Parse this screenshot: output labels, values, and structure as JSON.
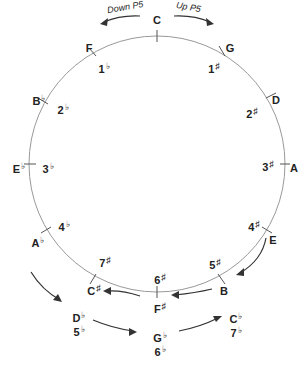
{
  "diagram": {
    "direction_labels": {
      "down": "Down P5",
      "up": "Up P5"
    },
    "keys": [
      {
        "note": "C",
        "acc": "",
        "sig": "",
        "sig_acc": ""
      },
      {
        "note": "G",
        "acc": "",
        "sig": "1",
        "sig_acc": "♯"
      },
      {
        "note": "D",
        "acc": "",
        "sig": "2",
        "sig_acc": "♯"
      },
      {
        "note": "A",
        "acc": "",
        "sig": "3",
        "sig_acc": "♯"
      },
      {
        "note": "E",
        "acc": "",
        "sig": "4",
        "sig_acc": "♯"
      },
      {
        "note": "B",
        "acc": "",
        "sig": "5",
        "sig_acc": "♯"
      },
      {
        "note": "F",
        "acc": "♯",
        "sig": "6",
        "sig_acc": "♯"
      },
      {
        "note": "C",
        "acc": "♯",
        "sig": "7",
        "sig_acc": "♯"
      },
      {
        "note": "A",
        "acc": "♭",
        "sig": "4",
        "sig_acc": "♭"
      },
      {
        "note": "E",
        "acc": "♭",
        "sig": "3",
        "sig_acc": "♭"
      },
      {
        "note": "B",
        "acc": "♭",
        "sig": "2",
        "sig_acc": "♭"
      },
      {
        "note": "F",
        "acc": "",
        "sig": "1",
        "sig_acc": "♭"
      }
    ],
    "enharmonic_outer": [
      {
        "note": "D",
        "acc": "♭",
        "sig": "5",
        "sig_acc": "♭"
      },
      {
        "note": "G",
        "acc": "♭",
        "sig": "6",
        "sig_acc": "♭"
      },
      {
        "note": "C",
        "acc": "♭",
        "sig": "7",
        "sig_acc": "♭"
      }
    ]
  }
}
